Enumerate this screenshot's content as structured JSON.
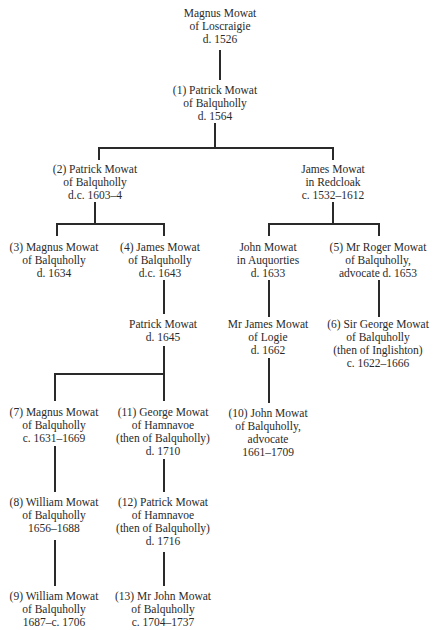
{
  "tree": {
    "title": "Mowat of Balquholly family tree",
    "nodes": {
      "magnus_loscraigie": {
        "lines": [
          "Magnus Mowat",
          "of Loscraigie",
          "d. 1526"
        ]
      },
      "patrick_1": {
        "lines": [
          "(1) Patrick Mowat",
          "of Balquholly",
          "d. 1564"
        ]
      },
      "patrick_2": {
        "lines": [
          "(2) Patrick Mowat",
          "of Balquholly",
          "d.c. 1603–4"
        ]
      },
      "james_redcloak": {
        "lines": [
          "James Mowat",
          "in Redcloak",
          "c. 1532–1612"
        ]
      },
      "magnus_3": {
        "lines": [
          "(3) Magnus Mowat",
          "of Balquholly",
          "d. 1634"
        ]
      },
      "james_4": {
        "lines": [
          "(4) James Mowat",
          "of Balquholly",
          "d.c. 1643"
        ]
      },
      "john_auquorties": {
        "lines": [
          "John Mowat",
          "in Auquorties",
          "d. 1633"
        ]
      },
      "roger_5": {
        "lines": [
          "(5) Mr Roger Mowat",
          "of Balquholly,",
          "advocate d. 1653"
        ]
      },
      "patrick_1645": {
        "lines": [
          "Patrick Mowat",
          "d. 1645"
        ]
      },
      "james_logie": {
        "lines": [
          "Mr James Mowat",
          "of Logie",
          "d. 1662"
        ]
      },
      "george_6": {
        "lines": [
          "(6) Sir George Mowat",
          "of Balquholly",
          "(then of Inglishton)",
          "c. 1622–1666"
        ]
      },
      "magnus_7": {
        "lines": [
          "(7) Magnus Mowat",
          "of Balquholly",
          "c. 1631–1669"
        ]
      },
      "george_11": {
        "lines": [
          "(11) George Mowat",
          "of Hamnavoe",
          "(then of Balquholly)",
          "d. 1710"
        ]
      },
      "john_10": {
        "lines": [
          "(10) John Mowat",
          "of Balquholly,",
          "advocate",
          "1661–1709"
        ]
      },
      "william_8": {
        "lines": [
          "(8) William Mowat",
          "of Balquholly",
          "1656–1688"
        ]
      },
      "patrick_12": {
        "lines": [
          "(12) Patrick Mowat",
          "of Hamnavoe",
          "(then of Balquholly)",
          "d. 1716"
        ]
      },
      "william_9": {
        "lines": [
          "(9) William Mowat",
          "of Balquholly",
          "1687–c. 1706"
        ]
      },
      "john_13": {
        "lines": [
          "(13) Mr John Mowat",
          "of Balquholly",
          "c. 1704–1737"
        ]
      }
    },
    "line_color": "#2a2a2a"
  }
}
